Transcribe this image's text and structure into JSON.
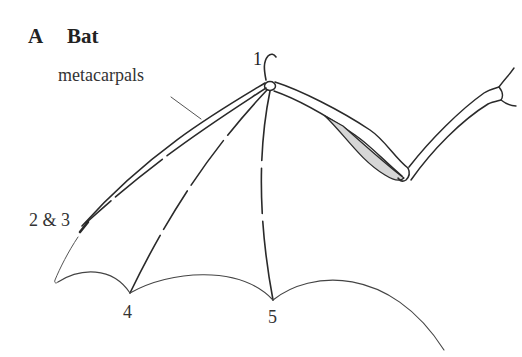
{
  "figure": {
    "panel_letter": "A",
    "title": "Bat",
    "labels": {
      "metacarpals": "metacarpals",
      "digit_1": "1",
      "digits_2_3": "2 & 3",
      "digit_4": "4",
      "digit_5": "5"
    },
    "colors": {
      "line": "#2a2a2a",
      "membrane": "#555555",
      "shading": "#d6d6d6",
      "background": "#ffffff"
    }
  }
}
